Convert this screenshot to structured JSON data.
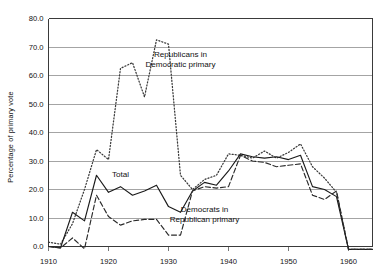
{
  "chart_data": {
    "type": "line",
    "title": "",
    "xlabel": "",
    "ylabel": "Percentage of primary vote",
    "xlim": [
      1910,
      1964
    ],
    "ylim": [
      0.0,
      80.0
    ],
    "grid": true,
    "legend_position": "inline-annotations",
    "yticks": [
      "0.0",
      "10.0",
      "20.0",
      "30.0",
      "40.0",
      "50.0",
      "60.0",
      "70.0",
      "80.0"
    ],
    "ytick_values": [
      0.0,
      10.0,
      20.0,
      30.0,
      40.0,
      50.0,
      60.0,
      70.0,
      80.0
    ],
    "xticks": [
      "1910",
      "1920",
      "1930",
      "1940",
      "1950",
      "1960"
    ],
    "xtick_values": [
      1910,
      1920,
      1930,
      1940,
      1950,
      1960
    ],
    "annotations": [
      {
        "text_line1": "Republicans in",
        "text_line2": "Democratic primary",
        "x": 1932,
        "y": 66.5
      },
      {
        "text_line1": "Total",
        "x": 1922,
        "y": 24.5
      },
      {
        "text_line1": "Democrats in",
        "text_line2": "Republican primary",
        "x": 1936,
        "y": 12.0
      }
    ],
    "series": [
      {
        "name": "Republicans in Democratic primary",
        "style": "dotted",
        "color": "#3a3a3a",
        "x": [
          1910,
          1912,
          1914,
          1916,
          1918,
          1920,
          1922,
          1924,
          1926,
          1928,
          1930,
          1932,
          1934,
          1936,
          1938,
          1940,
          1942,
          1944,
          1946,
          1948,
          1950,
          1952,
          1954,
          1956,
          1958,
          1960,
          1962,
          1964
        ],
        "values": [
          1.5,
          0.8,
          8.0,
          20.0,
          34.0,
          30.5,
          62.5,
          64.5,
          52.5,
          72.5,
          71.0,
          25.0,
          20.0,
          23.5,
          25.0,
          32.5,
          32.0,
          31.0,
          33.5,
          31.0,
          33.0,
          36.0,
          28.0,
          24.0,
          19.0,
          -1.0,
          -1.0,
          -1.0
        ]
      },
      {
        "name": "Total",
        "style": "solid",
        "color": "#1a1a1a",
        "x": [
          1910,
          1912,
          1914,
          1916,
          1918,
          1920,
          1922,
          1924,
          1926,
          1928,
          1930,
          1932,
          1934,
          1936,
          1938,
          1940,
          1942,
          1944,
          1946,
          1948,
          1950,
          1952,
          1954,
          1956,
          1958,
          1960,
          1962,
          1964
        ],
        "values": [
          0.0,
          -0.5,
          12.0,
          9.0,
          25.0,
          19.0,
          21.0,
          18.0,
          19.5,
          21.5,
          14.0,
          12.0,
          19.5,
          22.5,
          21.5,
          26.5,
          32.5,
          31.5,
          31.0,
          31.5,
          30.5,
          32.0,
          21.0,
          20.0,
          17.5,
          -1.0,
          -1.0,
          -1.0
        ]
      },
      {
        "name": "Democrats in Republican primary",
        "style": "dashed",
        "color": "#2a2a2a",
        "x": [
          1910,
          1912,
          1914,
          1916,
          1918,
          1920,
          1922,
          1924,
          1926,
          1928,
          1930,
          1932,
          1934,
          1936,
          1938,
          1940,
          1942,
          1944,
          1946,
          1948,
          1950,
          1952,
          1954,
          1956,
          1958,
          1960,
          1962,
          1964
        ],
        "values": [
          0.0,
          -0.5,
          3.0,
          -0.8,
          18.0,
          10.5,
          7.5,
          9.0,
          9.5,
          9.5,
          4.0,
          4.0,
          19.5,
          21.0,
          20.5,
          21.0,
          32.0,
          30.0,
          29.5,
          28.0,
          28.5,
          29.0,
          18.0,
          16.5,
          19.5,
          -1.0,
          -1.0,
          -1.0
        ]
      }
    ]
  }
}
